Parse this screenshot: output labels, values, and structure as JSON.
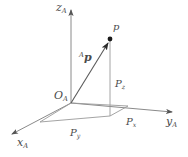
{
  "figure": {
    "background_color": "#ffffff",
    "line_color": "#6e6e6e",
    "text_color": "#4a4a4a",
    "axis_color": "#7a7a7a",
    "width_px": 188,
    "height_px": 157
  },
  "axes": {
    "z": {
      "label_main": "z",
      "label_sub": "A",
      "direction": "up"
    },
    "x": {
      "label_main": "x",
      "label_sub": "A",
      "direction": "lower-left"
    },
    "y": {
      "label_main": "y",
      "label_sub": "A",
      "direction": "right"
    }
  },
  "origin": {
    "label_main": "O",
    "label_sub": "A"
  },
  "point": {
    "label": "p"
  },
  "vector": {
    "superscript": "A",
    "label_main": "p"
  },
  "projections": [
    {
      "name": "projection-x",
      "label_main": "P",
      "label_sub": "x"
    },
    {
      "name": "projection-y",
      "label_main": "P",
      "label_sub": "y"
    },
    {
      "name": "projection-z",
      "label_main": "P",
      "label_sub": "z"
    }
  ],
  "geometry": {
    "origin_xy": [
      71,
      103
    ],
    "z_axis_tip": [
      71,
      8
    ],
    "x_axis_tip": [
      9,
      136
    ],
    "y_axis_tip": [
      176,
      113
    ],
    "point_p": [
      110,
      39
    ],
    "foot_of_p": [
      110,
      116
    ],
    "floor_corner_x": [
      128,
      106
    ],
    "floor_corner_y": [
      40,
      122
    ]
  }
}
